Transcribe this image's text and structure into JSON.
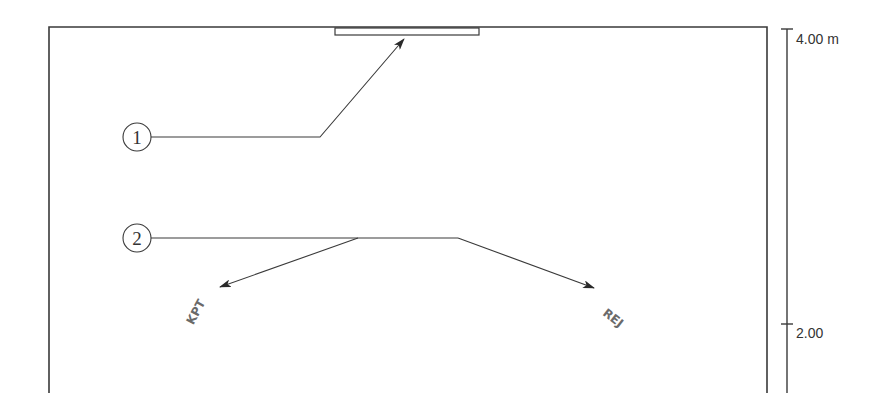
{
  "diagram": {
    "type": "room-section-elevation",
    "colors": {
      "line": "#3a3a3a",
      "text": "#333333",
      "glyph": "#6a6a6a",
      "background": "#ffffff"
    },
    "callouts": [
      {
        "id": "1",
        "label": "1",
        "target": "ceiling-fixture"
      },
      {
        "id": "2",
        "label": "2",
        "target": "wall-mounted-units"
      }
    ],
    "dimension": {
      "ticks": [
        {
          "label": "4.00 m",
          "value": 4.0
        },
        {
          "label": "2.00",
          "value": 2.0
        }
      ]
    },
    "glyphs": [
      {
        "name": "left-unit-symbol",
        "text": "KPT"
      },
      {
        "name": "right-unit-symbol",
        "text": "REJ"
      }
    ]
  }
}
